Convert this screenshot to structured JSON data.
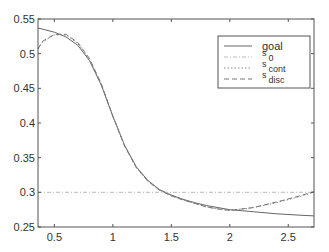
{
  "chart_data": {
    "type": "line",
    "title": "",
    "xlabel": "",
    "ylabel": "",
    "xlim": [
      0.36,
      2.72
    ],
    "ylim": [
      0.25,
      0.55
    ],
    "grid": false,
    "legend_position": "upper right",
    "xticks": [
      0.5,
      1,
      1.5,
      2,
      2.5
    ],
    "xtick_labels": [
      "0.5",
      "1",
      "1.5",
      "2",
      "2.5"
    ],
    "yticks": [
      0.25,
      0.3,
      0.35,
      0.4,
      0.45,
      0.5,
      0.55
    ],
    "ytick_labels": [
      "0.25",
      "0.3",
      "0.35",
      "0.4",
      "0.45",
      "0.5",
      "0.55"
    ],
    "series": [
      {
        "name": "goal",
        "label_main": "goal",
        "label_sub": "",
        "style": "solid",
        "color": "#666666",
        "x": [
          0.36,
          0.5,
          0.6,
          0.7,
          0.8,
          0.9,
          1.0,
          1.1,
          1.2,
          1.3,
          1.4,
          1.5,
          1.6,
          1.7,
          1.8,
          1.9,
          2.0,
          2.2,
          2.4,
          2.6,
          2.72
        ],
        "y": [
          0.537,
          0.531,
          0.524,
          0.512,
          0.49,
          0.455,
          0.41,
          0.368,
          0.337,
          0.317,
          0.304,
          0.296,
          0.29,
          0.285,
          0.281,
          0.278,
          0.275,
          0.272,
          0.269,
          0.267,
          0.266
        ]
      },
      {
        "name": "s_0",
        "label_main": "s",
        "label_sub": "0",
        "style": "dashdot",
        "color": "#bbbbbb",
        "x": [
          0.36,
          2.72
        ],
        "y": [
          0.3,
          0.3
        ]
      },
      {
        "name": "s_cont",
        "label_main": "s",
        "label_sub": "cont",
        "style": "dotted",
        "color": "#888888",
        "x": [
          0.36,
          0.4,
          0.5,
          0.6,
          0.7,
          0.8,
          0.9,
          1.0,
          1.1,
          1.2,
          1.3,
          1.4,
          1.5,
          1.6,
          1.7,
          1.8,
          1.9,
          2.0,
          2.2,
          2.4,
          2.6,
          2.72
        ],
        "y": [
          0.507,
          0.517,
          0.527,
          0.527,
          0.515,
          0.492,
          0.456,
          0.41,
          0.368,
          0.336,
          0.316,
          0.303,
          0.295,
          0.289,
          0.284,
          0.279,
          0.276,
          0.274,
          0.278,
          0.285,
          0.294,
          0.3
        ]
      },
      {
        "name": "s_disc",
        "label_main": "s",
        "label_sub": "disc",
        "style": "dashed",
        "color": "#777777",
        "x": [
          0.36,
          0.4,
          0.5,
          0.6,
          0.7,
          0.8,
          0.9,
          1.0,
          1.1,
          1.2,
          1.3,
          1.4,
          1.5,
          1.6,
          1.7,
          1.8,
          1.9,
          2.0,
          2.2,
          2.4,
          2.6,
          2.72
        ],
        "y": [
          0.507,
          0.518,
          0.528,
          0.528,
          0.516,
          0.493,
          0.457,
          0.41,
          0.367,
          0.336,
          0.316,
          0.303,
          0.295,
          0.289,
          0.284,
          0.279,
          0.276,
          0.274,
          0.278,
          0.286,
          0.295,
          0.301
        ]
      }
    ]
  },
  "frame": {
    "left": 38,
    "right": 314,
    "top": 19,
    "bottom": 227
  },
  "legend": {
    "x": 218,
    "y": 36,
    "width": 92,
    "height": 52
  }
}
